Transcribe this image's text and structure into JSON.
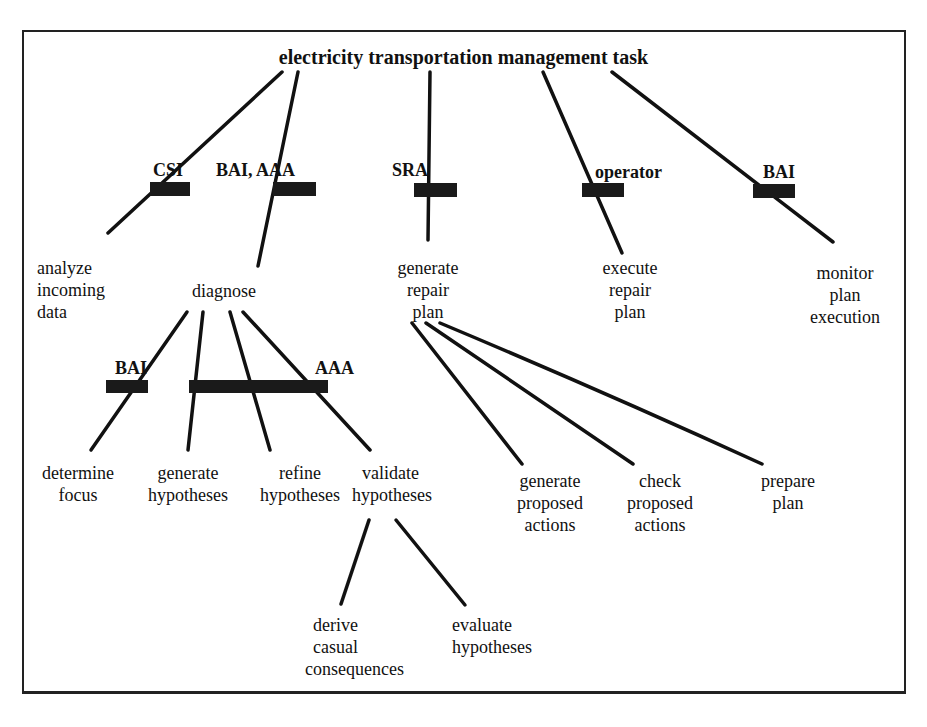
{
  "diagram": {
    "title": "electricity transportation management task",
    "agents": {
      "csi": "CSI",
      "bai_aaa": "BAI, AAA",
      "sra": "SRA",
      "operator": "operator",
      "bai_monitor": "BAI",
      "bai_focus": "BAI",
      "aaa_hypotheses": "AAA"
    },
    "level1": [
      {
        "id": "analyze",
        "lines": [
          "analyze",
          "incoming",
          "data"
        ],
        "agent": "CSI"
      },
      {
        "id": "diagnose",
        "lines": [
          "diagnose"
        ],
        "agent": "BAI, AAA"
      },
      {
        "id": "generate-repair-plan",
        "lines": [
          "generate",
          "repair",
          "plan"
        ],
        "agent": "SRA"
      },
      {
        "id": "execute-repair-plan",
        "lines": [
          "execute",
          "repair",
          "plan"
        ],
        "agent": "operator"
      },
      {
        "id": "monitor-plan-execution",
        "lines": [
          "monitor",
          "plan",
          "execution"
        ],
        "agent": "BAI"
      }
    ],
    "diagnose_children": [
      {
        "id": "determine-focus",
        "lines": [
          "determine",
          "focus"
        ],
        "agent": "BAI"
      },
      {
        "id": "generate-hypotheses",
        "lines": [
          "generate",
          "hypotheses"
        ],
        "agent": "AAA"
      },
      {
        "id": "refine-hypotheses",
        "lines": [
          "refine",
          "hypotheses"
        ],
        "agent": "AAA"
      },
      {
        "id": "validate-hypotheses",
        "lines": [
          "validate",
          "hypotheses"
        ],
        "agent": "AAA"
      }
    ],
    "validate_children": [
      {
        "id": "derive-causal-consequences",
        "lines": [
          "derive",
          "casual",
          "consequences"
        ]
      },
      {
        "id": "evaluate-hypotheses",
        "lines": [
          "evaluate",
          "hypotheses"
        ]
      }
    ],
    "repair_plan_children": [
      {
        "id": "generate-proposed-actions",
        "lines": [
          "generate",
          "proposed",
          "actions"
        ]
      },
      {
        "id": "check-proposed-actions",
        "lines": [
          "check",
          "proposed",
          "actions"
        ]
      },
      {
        "id": "prepare-plan",
        "lines": [
          "prepare",
          "plan"
        ]
      }
    ],
    "colors": {
      "line": "#111111",
      "bar": "#1a1a1a",
      "frame": "#222222",
      "background": "#ffffff"
    }
  }
}
